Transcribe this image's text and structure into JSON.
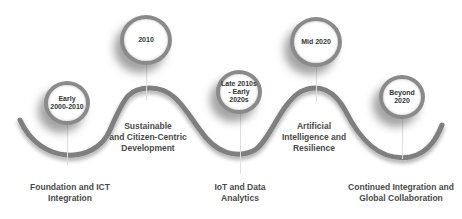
{
  "diagram": {
    "type": "wavy-timeline",
    "colors": {
      "wave": "#7f7f7f",
      "marker_ring": "#8a8a8a",
      "text": "#4a4a4a",
      "stem": "#dedede"
    },
    "milestones": [
      {
        "period": "Early\n2000-2010",
        "label": "Foundation and ICT\nIntegration"
      },
      {
        "period": "2010",
        "label": "Sustainable\nand Citizen-Centric\nDevelopment"
      },
      {
        "period": "Late 2010s\n- Early\n2020s",
        "label": "IoT and Data\nAnalytics"
      },
      {
        "period": "Mid 2020",
        "label": "Artificial\nIntelligence and\nResilience"
      },
      {
        "period": "Beyond\n2020",
        "label": "Continued Integration and\nGlobal Collaboration"
      }
    ]
  }
}
